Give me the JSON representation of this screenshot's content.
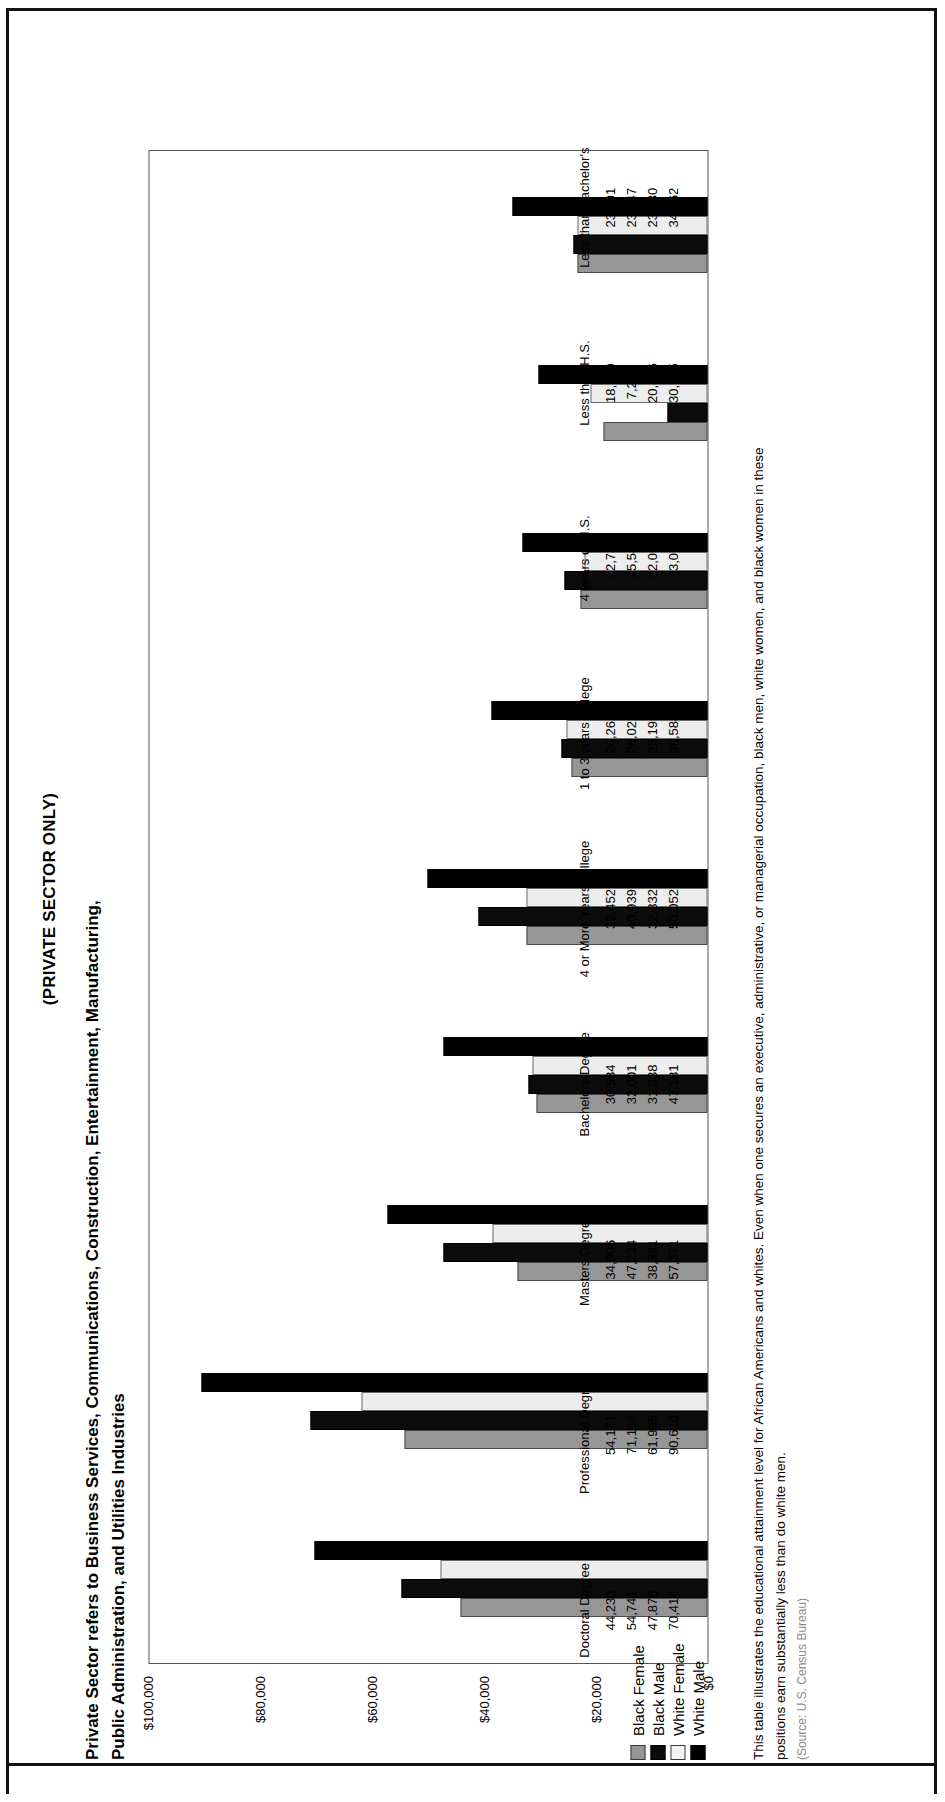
{
  "header": {
    "subtitle": "(PRIVATE SECTOR ONLY)",
    "title_line1": "Private Sector refers to Business Services, Communications, Construction, Entertainment, Manufacturing,",
    "title_line2": "Public Administration, and Utilities Industries"
  },
  "legend": {
    "items": [
      {
        "label": "Black Female",
        "color": "#969696"
      },
      {
        "label": "Black Male",
        "color": "#0b0b0b"
      },
      {
        "label": "White Female",
        "color": "#f3f3f3"
      },
      {
        "label": "White Male",
        "color": "#000000"
      }
    ]
  },
  "footnote": {
    "line1": "This table illustrates the educational attainment level for African Americans and whites. Even when one secures an executive, administrative, or managerial occupation, black men, white women, and black women in these",
    "line2": "positions earn substantially less than do white men.",
    "line3": "(Source: U.S. Census Bureau)"
  },
  "chart_data": {
    "type": "bar",
    "title": "(PRIVATE SECTOR ONLY)",
    "xlabel": "",
    "ylabel": "",
    "ylim": [
      0,
      100000
    ],
    "yticks": [
      "$0",
      "$20,000",
      "$40,000",
      "$60,000",
      "$80,000",
      "$100,000"
    ],
    "ytick_values": [
      0,
      20000,
      40000,
      60000,
      80000,
      100000
    ],
    "grid": false,
    "legend_position": "below-left",
    "orientation": "vertical",
    "categories": [
      "Doctoral Degree",
      "Professional Degree",
      "Masters Degree",
      "Bachelors Degree",
      "4 or More Years college",
      "1 to 3 years college",
      "4 years of H.S.",
      "Less than H.S.",
      "Less than Bachelor's"
    ],
    "series": [
      {
        "name": "Black Female",
        "values": [
          44230,
          54171,
          34006,
          30584,
          32452,
          24262,
          22732,
          18629,
          23291
        ]
      },
      {
        "name": "Black Male",
        "values": [
          54741,
          71114,
          47234,
          32001,
          40939,
          26027,
          25534,
          7203,
          23947
        ]
      },
      {
        "name": "White Female",
        "values": [
          47876,
          61995,
          38391,
          31338,
          32332,
          25195,
          22015,
          20876,
          23230
        ]
      },
      {
        "name": "White Male",
        "values": [
          70414,
          90610,
          57371,
          47181,
          50052,
          38588,
          33074,
          30275,
          34862
        ]
      }
    ],
    "value_labels": [
      {
        "category": "Doctoral Degree",
        "rows": [
          "44,230",
          "54,741",
          "47,876",
          "70,414"
        ]
      },
      {
        "category": "Professional Degree",
        "rows": [
          "54,171",
          "71,114",
          "61,995",
          "90,610"
        ]
      },
      {
        "category": "Masters Degree",
        "rows": [
          "34,006",
          "47,234",
          "38,391",
          "57,371"
        ]
      },
      {
        "category": "Bachelors Degree",
        "rows": [
          "30,584",
          "32,001",
          "31,338",
          "47,181"
        ]
      },
      {
        "category": "4 or More Years college",
        "rows": [
          "32,452",
          "40,939",
          "32,332",
          "50,052"
        ]
      },
      {
        "category": "1 to 3 years college",
        "rows": [
          "24,262",
          "26,027",
          "25,195",
          "38,588"
        ]
      },
      {
        "category": "4 years of H.S.",
        "rows": [
          "22,732",
          "25,534",
          "22,015",
          "33,074"
        ]
      },
      {
        "category": "Less than H.S.",
        "rows": [
          "18,629",
          "7,203",
          "20,876",
          "30,275"
        ]
      },
      {
        "category": "Less than Bachelor's",
        "rows": [
          "23,291",
          "23,947",
          "23,230",
          "34,862"
        ]
      }
    ]
  }
}
